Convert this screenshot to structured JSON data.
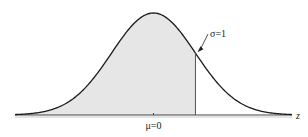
{
  "chart_data": {
    "type": "area",
    "title": "",
    "distribution": "standard normal",
    "mean": 0,
    "sd": 1,
    "xlabel": "z",
    "ylabel": "",
    "xlim": [
      -3.3,
      3.3
    ],
    "shaded_region": {
      "from": -3.3,
      "to": 1.0
    },
    "tick_labels": [
      {
        "x": 0,
        "label": "μ=0"
      }
    ],
    "annotations": [
      {
        "text": "σ=1",
        "points_to_x": 1.0
      }
    ],
    "grid": false,
    "legend": "none"
  },
  "colors": {
    "curve": "#1a1a1a",
    "shade": "#e6e6e6",
    "axis": "#444444"
  }
}
